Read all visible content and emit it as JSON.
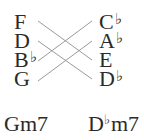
{
  "diagram": {
    "left_chord": {
      "name": "Gm7",
      "notes": [
        {
          "letter": "F",
          "accidental": ""
        },
        {
          "letter": "D",
          "accidental": ""
        },
        {
          "letter": "B",
          "accidental": "♭"
        },
        {
          "letter": "G",
          "accidental": ""
        }
      ]
    },
    "right_chord": {
      "name_root": "D",
      "name_accidental": "♭",
      "name_quality": "m7",
      "notes": [
        {
          "letter": "C",
          "accidental": "♭"
        },
        {
          "letter": "A",
          "accidental": "♭"
        },
        {
          "letter": "E",
          "accidental": ""
        },
        {
          "letter": "D",
          "accidental": "♭"
        }
      ]
    },
    "connections": [
      {
        "from": "F",
        "to": "E"
      },
      {
        "from": "D",
        "to": "D♭"
      },
      {
        "from": "B♭",
        "to": "C♭"
      },
      {
        "from": "G",
        "to": "A♭"
      }
    ],
    "line_color": "#9a9a9a",
    "text_color": "#2a2a2a"
  }
}
